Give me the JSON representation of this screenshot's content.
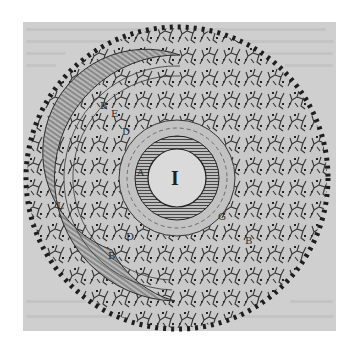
{
  "image": {
    "description": "Antique woodcut/engraving of a circular cross-section: a central white disc marked with a numeral, surrounded by a finely hatched ring, a crescent-shaped hatched band on the left, and an outer field of branching vein-like texture bordered by a ring of dark dots, on a gray page with faint show-through text.",
    "center_label": "I",
    "labels": [
      {
        "text": "B",
        "x": 100,
        "y": 101
      },
      {
        "text": "E",
        "x": 111,
        "y": 109
      },
      {
        "text": "D",
        "x": 122,
        "y": 127
      },
      {
        "text": "A",
        "x": 137,
        "y": 168
      },
      {
        "text": "L",
        "x": 57,
        "y": 201
      },
      {
        "text": "D",
        "x": 126,
        "y": 232
      },
      {
        "text": "B",
        "x": 108,
        "y": 251
      },
      {
        "text": "G",
        "x": 218,
        "y": 212
      },
      {
        "text": "B",
        "x": 245,
        "y": 236
      }
    ],
    "colors": {
      "page": "#ffffff",
      "panel": "#cfcfcf",
      "ink": "#2a2a2a",
      "inner_disc": "#dadada"
    }
  }
}
